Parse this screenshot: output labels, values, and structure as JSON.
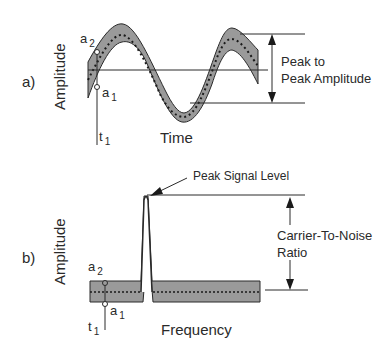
{
  "panel_a": {
    "label": "a)",
    "y_axis_label": "Amplitude",
    "x_axis_label": "Time",
    "point_top": {
      "base": "a",
      "sub": "2"
    },
    "point_bottom": {
      "base": "a",
      "sub": "1"
    },
    "time_marker": {
      "base": "t",
      "sub": "1"
    },
    "measure_label_line1": "Peak to",
    "measure_label_line2": "Peak Amplitude"
  },
  "panel_b": {
    "label": "b)",
    "y_axis_label": "Amplitude",
    "x_axis_label": "Frequency",
    "point_top": {
      "base": "a",
      "sub": "2"
    },
    "point_bottom": {
      "base": "a",
      "sub": "1"
    },
    "time_marker": {
      "base": "t",
      "sub": "1"
    },
    "peak_label": "Peak Signal Level",
    "measure_label_line1": "Carrier-To-Noise",
    "measure_label_line2": "Ratio"
  },
  "colors": {
    "band_fill": "#9a9a9a",
    "line": "#2a2a2a",
    "background": "#ffffff"
  }
}
